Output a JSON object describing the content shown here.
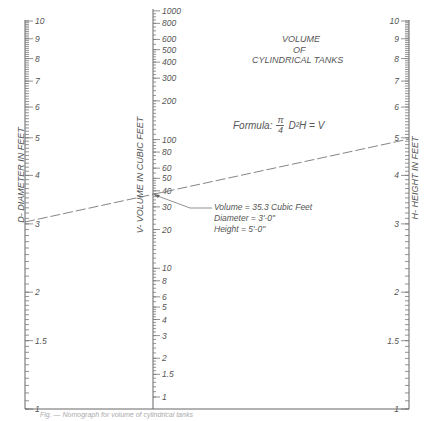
{
  "title": {
    "line1": "VOLUME",
    "line2": "OF",
    "line3": "CYLINDRICAL TANKS"
  },
  "formula": {
    "prefix": "Formula:",
    "numerator": "π",
    "denominator": "4",
    "expression": "D²H = V"
  },
  "axes": {
    "left": {
      "label": "D- DIAMETER IN FEET",
      "ticks": [
        "10",
        "9",
        "8",
        "7",
        "6",
        "5",
        "4",
        "3",
        "2",
        "1.5",
        "1"
      ]
    },
    "middle": {
      "label": "V- VOLUME IN CUBIC FEET",
      "ticks": [
        "1000",
        "800",
        "600",
        "500",
        "400",
        "300",
        "200",
        "100",
        "80",
        "60",
        "50",
        "40",
        "30",
        "20",
        "10",
        "8",
        "6",
        "5",
        "4",
        "3",
        "2",
        "1.5",
        "1"
      ]
    },
    "right": {
      "label": "H- HEIGHT IN FEET",
      "ticks": [
        "10",
        "9",
        "8",
        "7",
        "6",
        "5",
        "4",
        "3",
        "2",
        "1.5",
        "1"
      ]
    }
  },
  "example": {
    "volume": "Volume = 35.3 Cubic Feet",
    "diameter": "Diameter = 3'-0\"",
    "height": "Height = 5'-0\""
  },
  "caption": "Fig. — Nomograph for volume of cylindrical tanks"
}
